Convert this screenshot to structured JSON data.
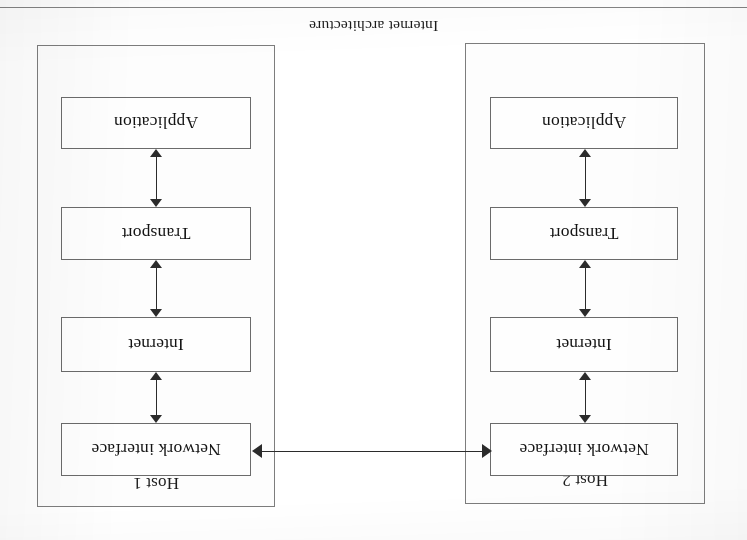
{
  "page": {
    "caption": "Internet architecture",
    "rotation_degrees": 180,
    "background_color": "#ffffff",
    "ink_color": "#1a1a1a",
    "line_color": "#7d7d7d",
    "arrow_color": "#2b2b2b"
  },
  "diagram": {
    "title": "Internet architecture",
    "hosts": [
      {
        "id": "host-left",
        "label": "Host 2",
        "layers": [
          {
            "name": "Network interface"
          },
          {
            "name": "Internet"
          },
          {
            "name": "Transport"
          },
          {
            "name": "Application"
          }
        ]
      },
      {
        "id": "host-right",
        "label": "Host 1",
        "layers": [
          {
            "name": "Network interface"
          },
          {
            "name": "Internet"
          },
          {
            "name": "Transport"
          },
          {
            "name": "Application"
          }
        ]
      }
    ],
    "connectors": {
      "vertical": "double-headed-arrow",
      "horizontal_link": "double-headed-arrow"
    }
  }
}
